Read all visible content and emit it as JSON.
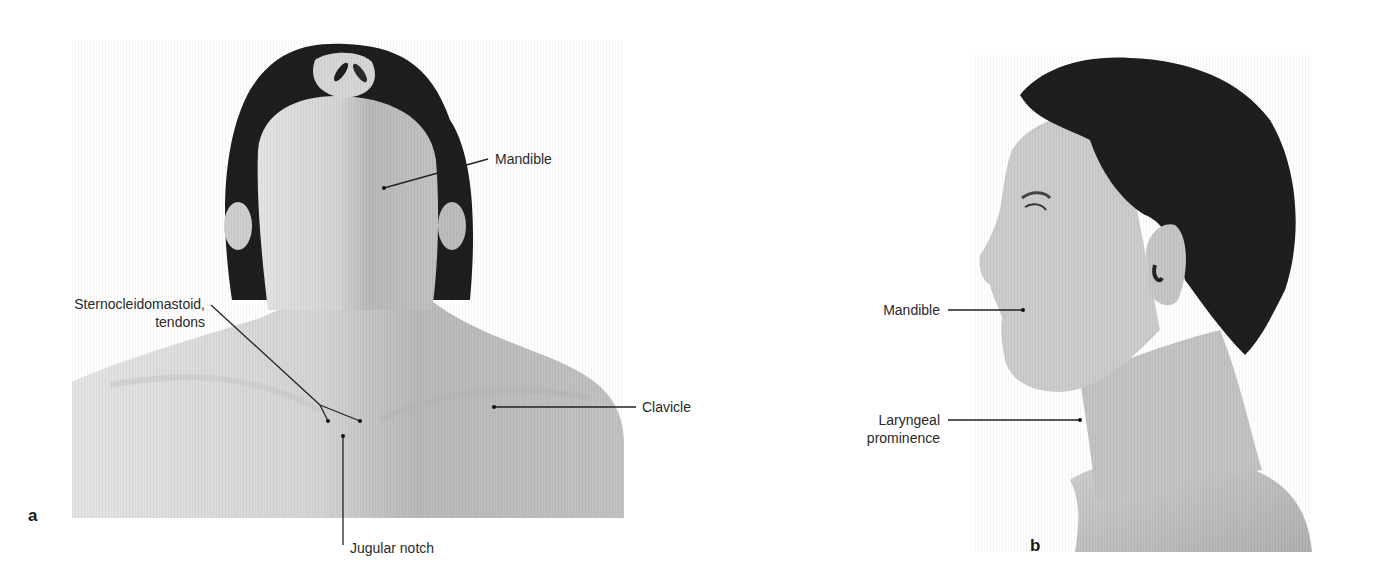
{
  "figure": {
    "panels": [
      {
        "id": "a",
        "letter": "a",
        "view": "anterior view, head extended",
        "labels": {
          "mandible": "Mandible",
          "sternocleidomastoid_line1": "Sternocleidomastoid,",
          "sternocleidomastoid_line2": "tendons",
          "clavicle": "Clavicle",
          "jugular_notch": "Jugular notch"
        }
      },
      {
        "id": "b",
        "letter": "b",
        "view": "lateral view",
        "labels": {
          "mandible": "Mandible",
          "laryngeal_line1": "Laryngeal",
          "laryngeal_line2": "prominence"
        }
      }
    ],
    "colors": {
      "background": "#ffffff",
      "skin_light": "#d9d9d9",
      "skin_mid": "#bdbdbd",
      "skin_shadow": "#9e9e9e",
      "hair": "#1c1c1c",
      "leader_line": "#222222",
      "label_text": "#2a2a2a"
    }
  }
}
